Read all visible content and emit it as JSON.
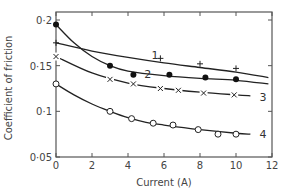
{
  "chart_data": {
    "type": "line",
    "title": "",
    "xlabel": "Current (A)",
    "ylabel": "Coefficient of friction",
    "xlim": [
      0,
      12
    ],
    "ylim": [
      0.05,
      0.2
    ],
    "xticks": [
      0,
      2,
      4,
      6,
      8,
      10,
      12
    ],
    "xtick_labels": [
      "0",
      "2",
      "4",
      "6",
      "8",
      "10",
      "12"
    ],
    "yticks": [
      0.05,
      0.1,
      0.15,
      0.2
    ],
    "ytick_labels": [
      "0·05",
      "0·1",
      "0·15",
      "0·2"
    ],
    "grid": false,
    "legend": "inline curve numbers at right end",
    "series": [
      {
        "name": "1",
        "marker": "plus",
        "points": [
          [
            0,
            0.175
          ],
          [
            5.8,
            0.158
          ],
          [
            8,
            0.152
          ],
          [
            10,
            0.147
          ]
        ],
        "curve": [
          [
            0,
            0.175
          ],
          [
            2,
            0.166
          ],
          [
            4,
            0.159
          ],
          [
            6,
            0.153
          ],
          [
            8,
            0.148
          ],
          [
            10,
            0.143
          ],
          [
            11.8,
            0.137
          ]
        ],
        "label_pos": [
          5.5,
          0.162
        ]
      },
      {
        "name": "2",
        "marker": "filled-circle",
        "points": [
          [
            0,
            0.195
          ],
          [
            3,
            0.15
          ],
          [
            4.3,
            0.14
          ],
          [
            6.3,
            0.14
          ],
          [
            8.3,
            0.137
          ],
          [
            10,
            0.135
          ]
        ],
        "curve": [
          [
            0,
            0.195
          ],
          [
            1,
            0.175
          ],
          [
            2,
            0.16
          ],
          [
            3,
            0.15
          ],
          [
            4,
            0.144
          ],
          [
            6,
            0.139
          ],
          [
            8,
            0.136
          ],
          [
            10,
            0.134
          ],
          [
            11.8,
            0.13
          ]
        ],
        "label_pos": [
          5.1,
          0.141
        ]
      },
      {
        "name": "3",
        "marker": "x",
        "points": [
          [
            0,
            0.16
          ],
          [
            3,
            0.135
          ],
          [
            4.3,
            0.13
          ],
          [
            5.8,
            0.125
          ],
          [
            6.8,
            0.123
          ],
          [
            8.2,
            0.12
          ],
          [
            9.9,
            0.118
          ]
        ],
        "curve": [
          [
            0,
            0.16
          ],
          [
            2,
            0.142
          ],
          [
            4,
            0.131
          ],
          [
            6,
            0.125
          ],
          [
            8,
            0.121
          ],
          [
            10,
            0.118
          ],
          [
            10.8,
            0.117
          ]
        ],
        "label_pos": [
          11.5,
          0.116
        ]
      },
      {
        "name": "4",
        "marker": "open-circle",
        "points": [
          [
            0,
            0.13
          ],
          [
            3,
            0.1
          ],
          [
            4.2,
            0.092
          ],
          [
            5.4,
            0.087
          ],
          [
            6.5,
            0.085
          ],
          [
            7.9,
            0.08
          ],
          [
            9,
            0.075
          ],
          [
            10,
            0.075
          ]
        ],
        "curve": [
          [
            0,
            0.13
          ],
          [
            1,
            0.118
          ],
          [
            2,
            0.108
          ],
          [
            3,
            0.1
          ],
          [
            4,
            0.093
          ],
          [
            5,
            0.088
          ],
          [
            6,
            0.085
          ],
          [
            8,
            0.08
          ],
          [
            10,
            0.076
          ],
          [
            10.8,
            0.075
          ]
        ],
        "label_pos": [
          11.5,
          0.075
        ]
      }
    ]
  },
  "layout": {
    "plot": {
      "left": 56,
      "right": 272,
      "top": 12,
      "bottom": 157
    },
    "y_top_value": 0.2,
    "y_top_px": 20
  }
}
